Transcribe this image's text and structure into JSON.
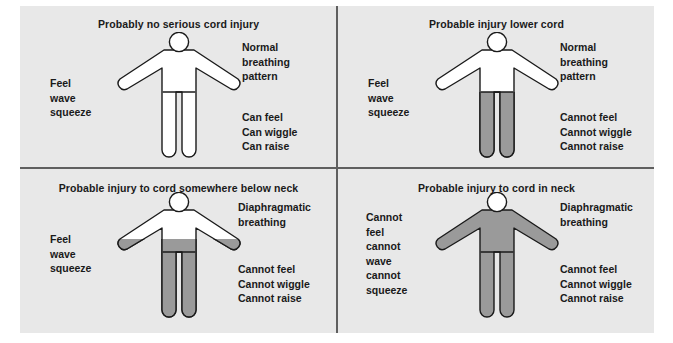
{
  "colors": {
    "page_background": "#ffffff",
    "panel_background": "#e8e8e8",
    "divider": "#5f5f5f",
    "figure_outline": "#1a1a1a",
    "figure_normal_fill": "#ffffff",
    "figure_impaired_fill": "#9a9a9a",
    "text": "#1a1a1a"
  },
  "quadrants": [
    {
      "id": "quad-1",
      "title": "Probably no serious cord injury",
      "breathing_label": [
        "Normal",
        "breathing",
        "pattern"
      ],
      "sensory_label": [
        "Feel",
        "wave",
        "squeeze"
      ],
      "motor_label": [
        "Can feel",
        "Can wiggle",
        "Can raise"
      ],
      "figure": {
        "head_fill": "#ffffff",
        "torso_fill": "#ffffff",
        "arms_fill": "#ffffff",
        "legs_fill": "#ffffff",
        "shaded_from": "none"
      }
    },
    {
      "id": "quad-2",
      "title": "Probable injury lower cord",
      "breathing_label": [
        "Normal",
        "breathing",
        "pattern"
      ],
      "sensory_label": [
        "Feel",
        "wave",
        "squeeze"
      ],
      "motor_label": [
        "Cannot feel",
        "Cannot wiggle",
        "Cannot raise"
      ],
      "figure": {
        "head_fill": "#ffffff",
        "torso_fill": "#ffffff",
        "arms_fill": "#ffffff",
        "legs_fill": "#9a9a9a",
        "shaded_from": "hips"
      }
    },
    {
      "id": "quad-3",
      "title": "Probable injury to cord somewhere below neck",
      "breathing_label": [
        "Diaphragmatic",
        "breathing"
      ],
      "sensory_label": [
        "Feel",
        "wave",
        "squeeze"
      ],
      "motor_label": [
        "Cannot feel",
        "Cannot wiggle",
        "Cannot raise"
      ],
      "figure": {
        "head_fill": "#ffffff",
        "torso_fill": "#ffffff",
        "arms_fill": "#ffffff",
        "legs_fill": "#9a9a9a",
        "shaded_from": "mid-torso"
      }
    },
    {
      "id": "quad-4",
      "title": "Probable injury to cord in neck",
      "breathing_label": [
        "Diaphragmatic",
        "breathing"
      ],
      "sensory_label": [
        "Cannot",
        "feel",
        "cannot",
        "wave",
        "cannot",
        "squeeze"
      ],
      "motor_label": [
        "Cannot feel",
        "Cannot wiggle",
        "Cannot raise"
      ],
      "figure": {
        "head_fill": "#ffffff",
        "torso_fill": "#9a9a9a",
        "arms_fill": "#9a9a9a",
        "legs_fill": "#9a9a9a",
        "shaded_from": "neck"
      }
    }
  ]
}
